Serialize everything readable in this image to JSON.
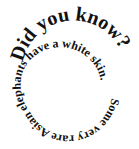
{
  "spiral": {
    "headline": "Did you know?",
    "body": "Some very rare Asian elephants have a white skin."
  }
}
